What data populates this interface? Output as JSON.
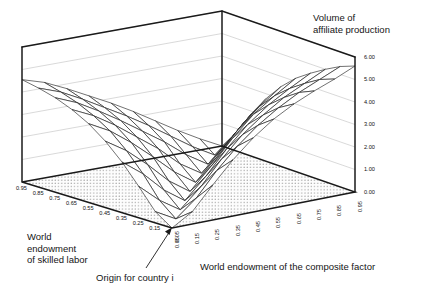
{
  "figure": {
    "title_line1": "Volume of",
    "title_line2": "affiliate production",
    "background": "#ffffff",
    "line_color": "#1a1a1a",
    "grid_color": "#c8c8c8",
    "floor_fill": "#fdfdfd",
    "floor_dot_color": "#3a3a3a"
  },
  "annotations": [
    {
      "name": "origin-callout",
      "text": "Origin for country i"
    }
  ],
  "axes": {
    "z": {
      "label": "Volume of affiliate production",
      "ticks": [
        "0.00",
        "1.00",
        "2.00",
        "3.00",
        "4.00",
        "5.00",
        "6.00"
      ],
      "values": [
        0,
        1,
        2,
        3,
        4,
        5,
        6
      ],
      "min": 0,
      "max": 6
    },
    "left": {
      "label_line1": "World",
      "label_line2": "endowment",
      "label_line3": "of skilled labor",
      "label": "World endowment of skilled labor",
      "ticks": [
        "0.95",
        "0.85",
        "0.75",
        "0.65",
        "0.55",
        "0.45",
        "0.35",
        "0.25",
        "0.15",
        "0.05"
      ],
      "values": [
        0.95,
        0.85,
        0.75,
        0.65,
        0.55,
        0.45,
        0.35,
        0.25,
        0.15,
        0.05
      ],
      "min": 0.05,
      "max": 0.95
    },
    "right": {
      "label": "World endowment of the composite factor",
      "ticks": [
        "0.05",
        "0.15",
        "0.25",
        "0.35",
        "0.45",
        "0.55",
        "0.65",
        "0.75",
        "0.85",
        "0.95"
      ],
      "values": [
        0.05,
        0.15,
        0.25,
        0.35,
        0.45,
        0.55,
        0.65,
        0.75,
        0.85,
        0.95
      ],
      "min": 0.05,
      "max": 0.95
    }
  },
  "chart_data": {
    "type": "surface",
    "xlabel": "World endowment of the composite factor",
    "ylabel": "World endowment of skilled labor",
    "zlabel": "Volume of affiliate production",
    "xlim": [
      0.05,
      0.95
    ],
    "ylim": [
      0.05,
      0.95
    ],
    "zlim": [
      0,
      6
    ],
    "grid": true,
    "legend": false,
    "x": [
      0.05,
      0.15,
      0.25,
      0.35,
      0.45,
      0.55,
      0.65,
      0.75,
      0.85,
      0.95
    ],
    "y": [
      0.05,
      0.15,
      0.25,
      0.35,
      0.45,
      0.55,
      0.65,
      0.75,
      0.85,
      0.95
    ],
    "z": [
      [
        0.0,
        0.55,
        1.55,
        2.5,
        3.3,
        3.95,
        4.45,
        4.85,
        5.2,
        5.6
      ],
      [
        0.5,
        0.0,
        0.75,
        1.8,
        2.7,
        3.45,
        4.05,
        4.55,
        4.95,
        5.35
      ],
      [
        1.4,
        0.6,
        0.0,
        0.85,
        1.9,
        2.8,
        3.5,
        4.1,
        4.55,
        5.0
      ],
      [
        2.25,
        1.55,
        0.65,
        0.0,
        0.9,
        1.95,
        2.85,
        3.55,
        4.1,
        4.6
      ],
      [
        2.95,
        2.35,
        1.55,
        0.65,
        0.0,
        0.95,
        2.0,
        2.9,
        3.55,
        4.15
      ],
      [
        3.5,
        3.0,
        2.3,
        1.5,
        0.65,
        0.0,
        0.95,
        2.0,
        2.85,
        3.55
      ],
      [
        3.9,
        3.45,
        2.85,
        2.15,
        1.45,
        0.6,
        0.0,
        0.95,
        1.95,
        2.8
      ],
      [
        4.2,
        3.8,
        3.25,
        2.65,
        2.0,
        1.35,
        0.6,
        0.0,
        0.9,
        1.9
      ],
      [
        4.4,
        4.05,
        3.55,
        3.0,
        2.45,
        1.85,
        1.2,
        0.55,
        0.0,
        0.85
      ],
      [
        4.55,
        4.25,
        3.8,
        3.3,
        2.8,
        2.25,
        1.65,
        1.05,
        0.5,
        0.0
      ]
    ]
  }
}
